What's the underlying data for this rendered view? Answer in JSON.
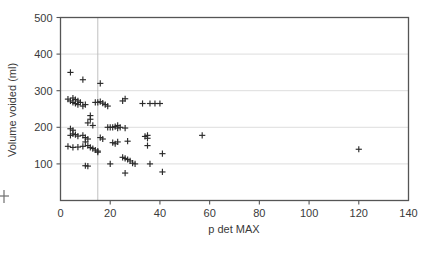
{
  "figure": {
    "background_color": "#ffffff",
    "frame_color": "#555555",
    "grid_color": "#d9d9d9",
    "marker_color": "#2b2b2b",
    "left_margin_mark_color": "#6f6f6f"
  },
  "chart_data": {
    "type": "scatter",
    "title": "",
    "xlabel": "p det MAX",
    "ylabel": "Volume voided (ml)",
    "xlim": [
      0,
      140
    ],
    "ylim": [
      0,
      500
    ],
    "xticks": [
      0,
      20,
      40,
      60,
      80,
      100,
      120,
      140
    ],
    "xtick_labels": [
      "0",
      "20",
      "40",
      "60",
      "80",
      "100",
      "120",
      "140"
    ],
    "yticks": [
      100,
      200,
      300,
      400,
      500
    ],
    "ytick_labels": [
      "100",
      "200",
      "300",
      "400",
      "500"
    ],
    "grid": "horizontal",
    "gridlines_y": [
      100,
      200,
      300,
      400
    ],
    "legend": "none",
    "marker_style": "plus",
    "annotations": [
      {
        "type": "vertical-reference-line",
        "x": 15,
        "label": ""
      }
    ],
    "series": [
      {
        "name": "patients",
        "marker": "plus",
        "points": [
          [
            4,
            350
          ],
          [
            9,
            330
          ],
          [
            16,
            320
          ],
          [
            3,
            277
          ],
          [
            4,
            272
          ],
          [
            5,
            280
          ],
          [
            5,
            268
          ],
          [
            6,
            276
          ],
          [
            6,
            265
          ],
          [
            7,
            272
          ],
          [
            7,
            262
          ],
          [
            8,
            268
          ],
          [
            9,
            258
          ],
          [
            10,
            262
          ],
          [
            14,
            268
          ],
          [
            15,
            268
          ],
          [
            16,
            270
          ],
          [
            17,
            266
          ],
          [
            18,
            262
          ],
          [
            19,
            258
          ],
          [
            25,
            272
          ],
          [
            26,
            278
          ],
          [
            33,
            265
          ],
          [
            36,
            265
          ],
          [
            38,
            265
          ],
          [
            40,
            265
          ],
          [
            12,
            232
          ],
          [
            12,
            222
          ],
          [
            11,
            212
          ],
          [
            13,
            205
          ],
          [
            4,
            196
          ],
          [
            5,
            192
          ],
          [
            5,
            182
          ],
          [
            4,
            178
          ],
          [
            6,
            180
          ],
          [
            7,
            176
          ],
          [
            9,
            178
          ],
          [
            10,
            172
          ],
          [
            11,
            168
          ],
          [
            10,
            160
          ],
          [
            19,
            200
          ],
          [
            20,
            200
          ],
          [
            21,
            200
          ],
          [
            22,
            202
          ],
          [
            23,
            205
          ],
          [
            23,
            198
          ],
          [
            24,
            200
          ],
          [
            26,
            198
          ],
          [
            16,
            172
          ],
          [
            17,
            168
          ],
          [
            21,
            158
          ],
          [
            22,
            155
          ],
          [
            23,
            160
          ],
          [
            27,
            162
          ],
          [
            34,
            175
          ],
          [
            35,
            178
          ],
          [
            35,
            170
          ],
          [
            57,
            178
          ],
          [
            120,
            140
          ],
          [
            3,
            148
          ],
          [
            5,
            145
          ],
          [
            7,
            146
          ],
          [
            9,
            148
          ],
          [
            11,
            150
          ],
          [
            12,
            145
          ],
          [
            13,
            142
          ],
          [
            14,
            138
          ],
          [
            15,
            135
          ],
          [
            15,
            132
          ],
          [
            35,
            150
          ],
          [
            41,
            128
          ],
          [
            25,
            118
          ],
          [
            26,
            115
          ],
          [
            27,
            112
          ],
          [
            28,
            108
          ],
          [
            29,
            102
          ],
          [
            10,
            95
          ],
          [
            11,
            94
          ],
          [
            20,
            100
          ],
          [
            30,
            100
          ],
          [
            36,
            100
          ],
          [
            26,
            75
          ],
          [
            41,
            78
          ]
        ]
      }
    ]
  },
  "margin_marks": {
    "left_edge_tick": true
  }
}
